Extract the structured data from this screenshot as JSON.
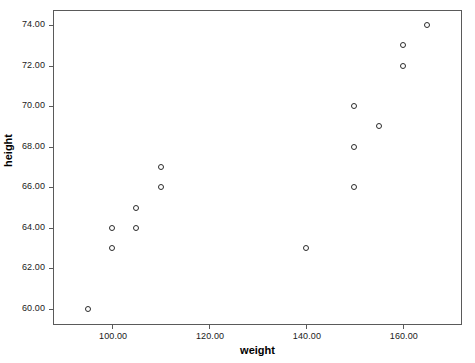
{
  "chart_data": {
    "type": "scatter",
    "title": "",
    "xlabel": "weight",
    "ylabel": "height",
    "xlim": [
      88,
      172
    ],
    "ylim": [
      59.25,
      74.7
    ],
    "grid": false,
    "legend": null,
    "x": [
      95,
      100,
      100,
      105,
      105,
      110,
      110,
      140,
      150,
      150,
      150,
      155,
      160,
      160,
      165
    ],
    "y": [
      60,
      63,
      64,
      64,
      65,
      66,
      67,
      63,
      66,
      68,
      70,
      69,
      72,
      73,
      74
    ],
    "points": [
      {
        "x": 95,
        "y": 60
      },
      {
        "x": 100,
        "y": 63
      },
      {
        "x": 100,
        "y": 64
      },
      {
        "x": 105,
        "y": 64
      },
      {
        "x": 105,
        "y": 65
      },
      {
        "x": 110,
        "y": 66
      },
      {
        "x": 110,
        "y": 67
      },
      {
        "x": 140,
        "y": 63
      },
      {
        "x": 150,
        "y": 66
      },
      {
        "x": 150,
        "y": 68
      },
      {
        "x": 150,
        "y": 70
      },
      {
        "x": 155,
        "y": 69
      },
      {
        "x": 160,
        "y": 72
      },
      {
        "x": 160,
        "y": 73
      },
      {
        "x": 165,
        "y": 74
      }
    ],
    "xticks": [
      100,
      120,
      140,
      160
    ],
    "xtick_labels": [
      "100.00",
      "120.00",
      "140.00",
      "160.00"
    ],
    "yticks": [
      60,
      62,
      64,
      66,
      68,
      70,
      72,
      74
    ],
    "ytick_labels": [
      "60.00",
      "62.00",
      "64.00",
      "66.00",
      "68.00",
      "70.00",
      "72.00",
      "74.00"
    ],
    "marker_style": "open-circle",
    "marker_color": "#2b2b2b",
    "frame_color": "#5a5a5a",
    "background_color": "#ffffff"
  }
}
